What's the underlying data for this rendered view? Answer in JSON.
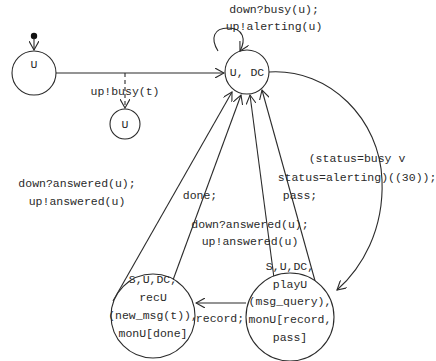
{
  "diagram": {
    "type": "state-machine",
    "states": [
      {
        "id": "s-u-init",
        "label": [
          "U"
        ]
      },
      {
        "id": "s-u-dc",
        "label": [
          "U, DC"
        ]
      },
      {
        "id": "s-u-busy",
        "label": [
          "U"
        ]
      },
      {
        "id": "s-rec",
        "label": [
          "S,U,DC,",
          "recU",
          "(new_msg(t)),",
          "monU[done]"
        ]
      },
      {
        "id": "s-play",
        "label": [
          "S,U,DC,",
          "playU",
          "(msg_query),",
          "monU[record,",
          "pass]"
        ]
      }
    ],
    "transitions": [
      {
        "id": "t-self",
        "from": "U, DC",
        "to": "U, DC",
        "label": [
          "down?busy(u);",
          "up!alerting(u)"
        ]
      },
      {
        "id": "t-busy",
        "from": "U",
        "to": "U",
        "style": "dashed",
        "label": [
          "up!busy(t)"
        ]
      },
      {
        "id": "t-timeout",
        "from": "U, DC",
        "to": "S,U,DC,playU",
        "label": [
          "(status=busy v",
          "status=alerting)((30));"
        ]
      },
      {
        "id": "t-rec-answered",
        "from": "S,U,DC,recU",
        "to": "U, DC",
        "label": [
          "down?answered(u);",
          "up!answered(u)"
        ]
      },
      {
        "id": "t-done",
        "from": "S,U,DC,recU",
        "to": "U, DC",
        "label": [
          "done;"
        ]
      },
      {
        "id": "t-play-answered",
        "from": "S,U,DC,playU",
        "to": "U, DC",
        "label": [
          "down?answered(u);",
          "up!answered(u)"
        ]
      },
      {
        "id": "t-pass",
        "from": "S,U,DC,playU",
        "to": "U, DC",
        "label": [
          "pass;"
        ]
      },
      {
        "id": "t-record",
        "from": "S,U,DC,playU",
        "to": "S,U,DC,recU",
        "label": [
          "record;"
        ]
      }
    ]
  }
}
